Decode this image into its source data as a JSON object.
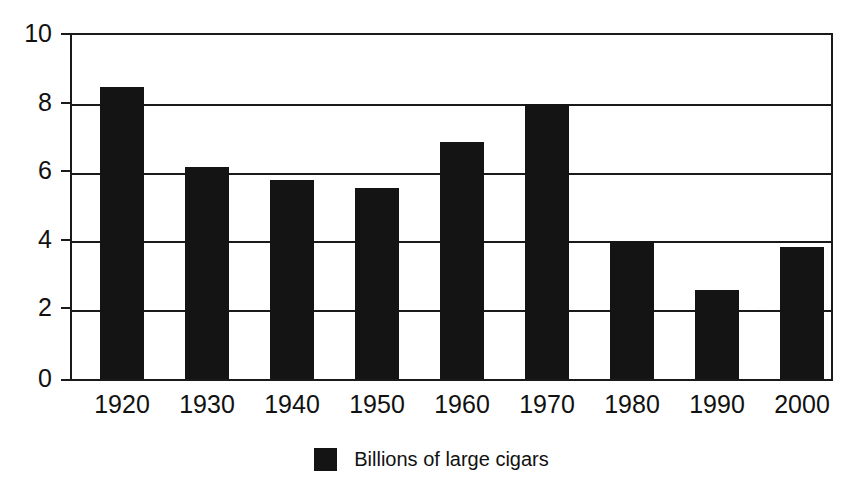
{
  "chart_data": {
    "type": "bar",
    "title": "",
    "subtitle": "",
    "xlabel": "",
    "ylabel": "",
    "categories": [
      "1920",
      "1930",
      "1940",
      "1950",
      "1960",
      "1970",
      "1980",
      "1990",
      "2000"
    ],
    "values": [
      8.5,
      6.15,
      5.8,
      5.55,
      6.9,
      8.0,
      4.0,
      2.6,
      3.85
    ],
    "series": [
      {
        "name": "Billions of large cigars",
        "values": [
          8.5,
          6.15,
          5.8,
          5.55,
          6.9,
          8.0,
          4.0,
          2.6,
          3.85
        ],
        "color": "#141414"
      }
    ],
    "ylim": [
      0,
      10
    ],
    "ytick_labels": [
      "0",
      "2",
      "4",
      "6",
      "8",
      "10"
    ],
    "ytick_values": [
      0,
      2,
      4,
      6,
      8,
      10
    ],
    "grid": true,
    "grid_axis": "y",
    "legend": {
      "position": "bottom-center",
      "entries": [
        {
          "label": "Billions of large cigars",
          "color": "#141414",
          "marker": "square-swatch"
        }
      ]
    },
    "bar_color": "#141414",
    "background_color": "#ffffff",
    "axis_color": "#1a1a1a"
  },
  "axes": {
    "y_labels": [
      "10",
      "8",
      "6",
      "4",
      "2",
      "0"
    ],
    "x_labels": [
      "1920",
      "1930",
      "1940",
      "1950",
      "1960",
      "1970",
      "1980",
      "1990",
      "2000"
    ]
  },
  "legend": {
    "label": "Billions of large cigars"
  },
  "title": {
    "text": ""
  }
}
